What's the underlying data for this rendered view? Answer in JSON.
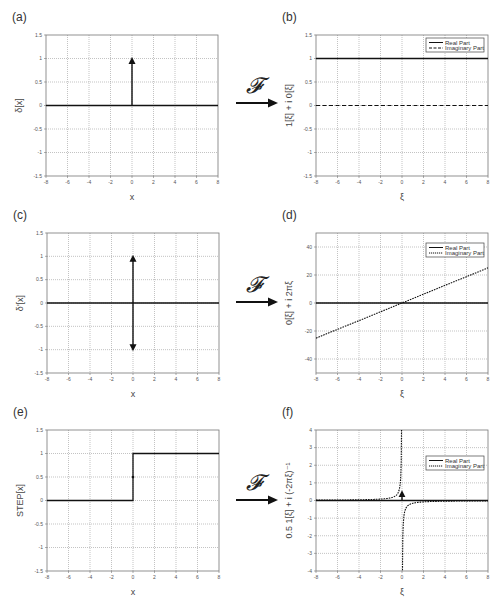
{
  "figure": {
    "transform_symbol": "𝓕",
    "arrow_color": "#111111",
    "grid_color": "#9a9a9a",
    "frame_color": "#777777",
    "line_color": "#111111"
  },
  "chart_data": [
    {
      "id": "a",
      "panel_label": "(a)",
      "type": "line",
      "title": "",
      "xlabel": "x",
      "ylabel": "δ[x]",
      "xlim": [
        -8,
        8
      ],
      "ylim": [
        -1.5,
        1.5
      ],
      "grid": true,
      "legend": null,
      "xticks": [
        -8,
        -6,
        -4,
        -2,
        0,
        2,
        4,
        6,
        8
      ],
      "yticks": [
        -1.5,
        -1,
        -0.5,
        0,
        0.5,
        1,
        1.5
      ],
      "series": [
        {
          "name": "baseline",
          "style": "solid",
          "x": [
            -8,
            8
          ],
          "y": [
            0,
            0
          ]
        },
        {
          "name": "delta impulse",
          "style": "arrow-up",
          "x": [
            0,
            0
          ],
          "y": [
            0,
            1
          ]
        }
      ],
      "frame": {
        "left": 46,
        "top": 35,
        "right": 218,
        "bottom": 176
      }
    },
    {
      "id": "b",
      "panel_label": "(b)",
      "type": "line",
      "title": "",
      "xlabel": "ξ",
      "ylabel": "1[ξ] + i 0[ξ]",
      "xlim": [
        -8,
        8
      ],
      "ylim": [
        -1.5,
        1.5
      ],
      "grid": true,
      "legend": {
        "position": "upper right",
        "entries": [
          {
            "label": "Real Part",
            "style": "solid"
          },
          {
            "label": "Imaginary Part",
            "style": "dashed"
          }
        ]
      },
      "xticks": [
        -8,
        -6,
        -4,
        -2,
        0,
        2,
        4,
        6,
        8
      ],
      "yticks": [
        -1.5,
        -1,
        -0.5,
        0,
        0.5,
        1,
        1.5
      ],
      "series": [
        {
          "name": "Real Part",
          "style": "solid",
          "x": [
            -8,
            8
          ],
          "y": [
            1,
            1
          ]
        },
        {
          "name": "Imaginary Part",
          "style": "dashed",
          "x": [
            -8,
            8
          ],
          "y": [
            0,
            0
          ]
        }
      ],
      "frame": {
        "left": 316,
        "top": 35,
        "right": 488,
        "bottom": 176
      }
    },
    {
      "id": "c",
      "panel_label": "(c)",
      "type": "line",
      "title": "",
      "xlabel": "x",
      "ylabel": "δ'[x]",
      "xlim": [
        -8,
        8
      ],
      "ylim": [
        -1.5,
        1.5
      ],
      "grid": true,
      "legend": null,
      "xticks": [
        -8,
        -6,
        -4,
        -2,
        0,
        2,
        4,
        6,
        8
      ],
      "yticks": [
        -1.5,
        -1,
        -0.5,
        0,
        0.5,
        1,
        1.5
      ],
      "series": [
        {
          "name": "baseline",
          "style": "solid",
          "x": [
            -8,
            8
          ],
          "y": [
            0,
            0
          ]
        },
        {
          "name": "doublet up",
          "style": "arrow-up",
          "x": [
            0,
            0
          ],
          "y": [
            0,
            1
          ]
        },
        {
          "name": "doublet down",
          "style": "arrow-down",
          "x": [
            0,
            0
          ],
          "y": [
            0,
            -1
          ]
        }
      ],
      "frame": {
        "left": 47,
        "top": 233,
        "right": 219,
        "bottom": 373
      }
    },
    {
      "id": "d",
      "panel_label": "(d)",
      "type": "line",
      "title": "",
      "xlabel": "ξ",
      "ylabel": "0[ξ] + i 2πξ",
      "xlim": [
        -8,
        8
      ],
      "ylim": [
        -50,
        50
      ],
      "grid": true,
      "legend": {
        "position": "upper right",
        "entries": [
          {
            "label": "Real Part",
            "style": "solid"
          },
          {
            "label": "Imaginary Part",
            "style": "dotted"
          }
        ]
      },
      "xticks": [
        -8,
        -6,
        -4,
        -2,
        0,
        2,
        4,
        6,
        8
      ],
      "yticks": [
        -40,
        -20,
        0,
        20,
        40
      ],
      "series": [
        {
          "name": "Real Part",
          "style": "solid",
          "x": [
            -8,
            8
          ],
          "y": [
            0,
            0
          ]
        },
        {
          "name": "Imaginary Part",
          "style": "dotted",
          "x": [
            -8,
            -6,
            -4,
            -2,
            0,
            2,
            4,
            6,
            8
          ],
          "y": [
            -25.1,
            -18.8,
            -12.6,
            -6.3,
            0,
            6.3,
            12.6,
            18.8,
            25.1
          ]
        }
      ],
      "frame": {
        "left": 316,
        "top": 233,
        "right": 488,
        "bottom": 373
      }
    },
    {
      "id": "e",
      "panel_label": "(e)",
      "type": "line",
      "title": "",
      "xlabel": "x",
      "ylabel": "STEP[x]",
      "xlim": [
        -8,
        8
      ],
      "ylim": [
        -1.5,
        1.5
      ],
      "grid": true,
      "legend": null,
      "xticks": [
        -8,
        -6,
        -4,
        -2,
        0,
        2,
        4,
        6,
        8
      ],
      "yticks": [
        -1.5,
        -1,
        -0.5,
        0,
        0.5,
        1,
        1.5
      ],
      "series": [
        {
          "name": "STEP",
          "style": "solid",
          "x": [
            -8,
            0,
            0,
            8
          ],
          "y": [
            0,
            0,
            1,
            1
          ]
        },
        {
          "name": "midpoint",
          "style": "dot",
          "x": [
            0
          ],
          "y": [
            0.5
          ]
        }
      ],
      "frame": {
        "left": 47,
        "top": 430,
        "right": 219,
        "bottom": 571
      }
    },
    {
      "id": "f",
      "panel_label": "(f)",
      "type": "line",
      "title": "",
      "xlabel": "ξ",
      "ylabel": "0.5 1[ξ] + i (-2πξ)⁻¹",
      "xlim": [
        -8,
        8
      ],
      "ylim": [
        -4,
        4
      ],
      "grid": true,
      "legend": {
        "position": "upper right",
        "entries": [
          {
            "label": "Real Part",
            "style": "solid"
          },
          {
            "label": "Imaginary Part",
            "style": "dotted"
          }
        ]
      },
      "xticks": [
        -8,
        -6,
        -4,
        -2,
        0,
        2,
        4,
        6,
        8
      ],
      "yticks": [
        -4,
        -3,
        -2,
        -1,
        0,
        1,
        2,
        3,
        4
      ],
      "series": [
        {
          "name": "Real Part",
          "style": "solid",
          "x": [
            -8,
            8
          ],
          "y": [
            0,
            0
          ]
        },
        {
          "name": "Real Part impulse (0.5δ)",
          "style": "arrow-up",
          "x": [
            0,
            0
          ],
          "y": [
            0,
            0.5
          ]
        },
        {
          "name": "Imaginary Part",
          "style": "dotted",
          "formula": "1/(2πξ) for ξ<0 → positive branch; -1/(2πξ) shown",
          "x": [
            -8,
            -4,
            -2,
            -1,
            -0.5,
            -0.25,
            -0.1,
            -0.04,
            0.04,
            0.1,
            0.25,
            0.5,
            1,
            2,
            4,
            8
          ],
          "y": [
            0.02,
            0.04,
            0.08,
            0.16,
            0.32,
            0.64,
            1.59,
            3.98,
            -3.98,
            -1.59,
            -0.64,
            -0.32,
            -0.16,
            -0.08,
            -0.04,
            -0.02
          ]
        }
      ],
      "frame": {
        "left": 316,
        "top": 430,
        "right": 488,
        "bottom": 571
      }
    }
  ],
  "arrows": [
    {
      "id": "ft-arrow-1",
      "x": 236,
      "y": 103
    },
    {
      "id": "ft-arrow-2",
      "x": 236,
      "y": 302
    },
    {
      "id": "ft-arrow-3",
      "x": 236,
      "y": 500
    }
  ]
}
